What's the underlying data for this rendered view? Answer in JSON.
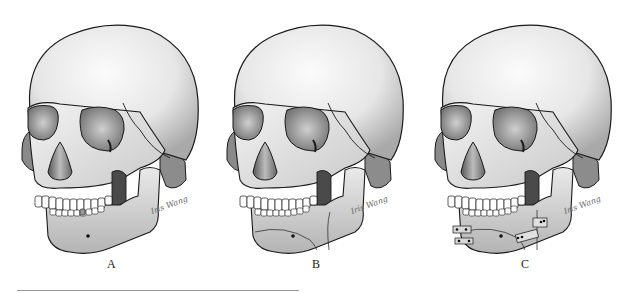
{
  "figure": {
    "panels": [
      {
        "label": "A",
        "description": "skull-intact-mandible",
        "signature": "Iris Wang"
      },
      {
        "label": "B",
        "description": "skull-mandible-osteotomy-lines",
        "signature": "Iris Wang"
      },
      {
        "label": "C",
        "description": "skull-mandible-with-fixation-plates",
        "signature": "Iris Wang"
      }
    ],
    "colors": {
      "background": "#ffffff",
      "bone_light": "#f2f2f2",
      "bone_mid": "#c8c8c8",
      "bone_dark": "#7a7a7a",
      "outline": "#1a1a1a",
      "footer_rule": "#9a9a9a"
    }
  }
}
